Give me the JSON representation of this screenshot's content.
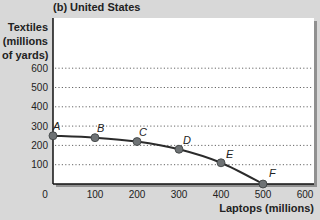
{
  "title": "(b) United States",
  "y_axis_label_lines": [
    "Textiles",
    "(millions",
    "of yards)"
  ],
  "x_axis_label": "Laptops (millions)",
  "colors": {
    "background": "#d8d8d8",
    "plot_bg": "#ffffff",
    "curve": "#2b2b2b",
    "point": "#6e7274",
    "grid": "#666666"
  },
  "chart_data": {
    "type": "line",
    "title": "(b) United States",
    "xlabel": "Laptops (millions)",
    "ylabel": "Textiles (millions of yards)",
    "xlim": [
      0,
      600
    ],
    "ylim": [
      0,
      600
    ],
    "x_ticks": [
      0,
      100,
      200,
      300,
      400,
      500,
      600
    ],
    "y_ticks": [
      100,
      200,
      300,
      400,
      500,
      600
    ],
    "grid": "horizontal dotted",
    "series": [
      {
        "name": "Production possibilities frontier",
        "points": [
          {
            "label": "A",
            "x": 0,
            "y": 250
          },
          {
            "label": "B",
            "x": 100,
            "y": 240
          },
          {
            "label": "C",
            "x": 200,
            "y": 220
          },
          {
            "label": "D",
            "x": 300,
            "y": 180
          },
          {
            "label": "E",
            "x": 400,
            "y": 110
          },
          {
            "label": "F",
            "x": 500,
            "y": 0
          }
        ]
      }
    ]
  }
}
